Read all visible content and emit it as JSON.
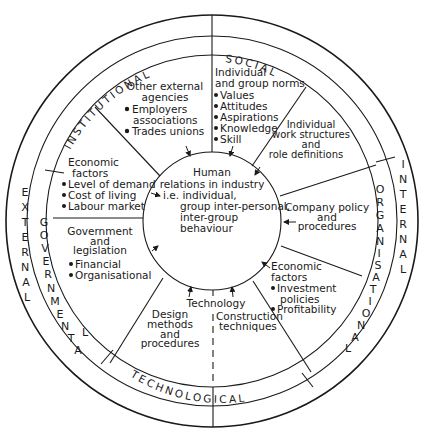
{
  "colors": {
    "ink": "#1a1a1a",
    "background": "#ffffff"
  },
  "outer_ring": {
    "left_label": [
      "E",
      "X",
      "T",
      "E",
      "R",
      "N",
      "A",
      "L"
    ],
    "right_label": [
      "I",
      "N",
      "T",
      "E",
      "R",
      "N",
      "A",
      "L"
    ]
  },
  "middle_ring": {
    "institutional": "INSTITUTIONAL",
    "social": "SOCIAL",
    "governmental": "GOVERNMENTAL",
    "organisational": "ORGANISATIONAL",
    "technological": "TECHNOLOGICAL"
  },
  "center": {
    "line1": "Human",
    "line2": "relations in industry",
    "line3": "i.e. individual,",
    "line4": "group inter-personal,",
    "line5": "inter-group",
    "line6": "behaviour"
  },
  "segments": {
    "other_agencies": {
      "title1": "Other external",
      "title2": "agencies",
      "items": [
        "Employers",
        "associations",
        "Trades unions"
      ]
    },
    "group_norms": {
      "title1": "Individual",
      "title2": "and group norms",
      "items": [
        "Values",
        "Attitudes",
        "Aspirations",
        "Knowledge",
        "Skill"
      ]
    },
    "work_structures": {
      "lines": [
        "Individual",
        "work structures",
        "and",
        "role definitions"
      ]
    },
    "company_policy": {
      "lines": [
        "Company policy",
        "and",
        "procedures"
      ]
    },
    "economic_internal": {
      "title1": "Economic",
      "title2": "factors",
      "items": [
        "Investment",
        "policies",
        "Profitability"
      ]
    },
    "technology": {
      "title": "Technology",
      "construction": [
        "Construction",
        "techniques"
      ],
      "design": [
        "Design",
        "methods",
        "and",
        "procedures"
      ]
    },
    "government": {
      "lines": [
        "Government",
        "and",
        "legislation"
      ],
      "items": [
        "Financial",
        "Organisational"
      ]
    },
    "economic_external": {
      "title1": "Economic",
      "title2": "factors",
      "items": [
        "Level of demand",
        "Cost of living",
        "Labour market"
      ]
    }
  }
}
